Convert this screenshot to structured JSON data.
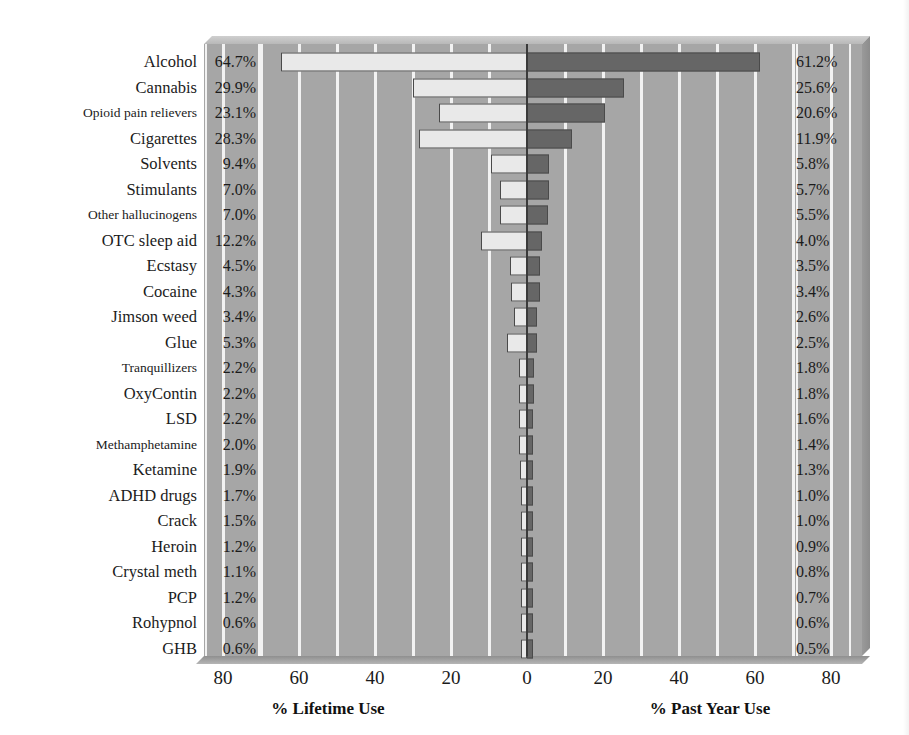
{
  "chart_data": {
    "type": "bar",
    "orientation": "horizontal",
    "layout": "diverging-bidirectional",
    "title": "",
    "subtitle": "",
    "xlabel_left": "% Lifetime Use",
    "xlabel_right": "% Past Year Use",
    "ylabel": "",
    "grid": true,
    "grid_orientation": "vertical",
    "legend": "none",
    "axis": {
      "left_max": 80,
      "right_max": 80,
      "tick_step": 20,
      "tick_labels": [
        "80",
        "60",
        "40",
        "20",
        "0",
        "20",
        "40",
        "60",
        "80"
      ],
      "tick_values": [
        -80,
        -60,
        -40,
        -20,
        0,
        20,
        40,
        60,
        80
      ],
      "gridline_step": 10
    },
    "categories": [
      "Alcohol",
      "Cannabis",
      "Opioid pain relievers",
      "Cigarettes",
      "Solvents",
      "Stimulants",
      "Other hallucinogens",
      "OTC sleep aid",
      "Ecstasy",
      "Cocaine",
      "Jimson weed",
      "Glue",
      "Tranquillizers",
      "OxyContin",
      "LSD",
      "Methamphetamine",
      "Ketamine",
      "ADHD drugs",
      "Crack",
      "Heroin",
      "Crystal meth",
      "PCP",
      "Rohypnol",
      "GHB"
    ],
    "series": [
      {
        "name": "% Lifetime Use",
        "side": "left",
        "color": "#e9e9e9",
        "values": [
          64.7,
          29.9,
          23.1,
          28.3,
          9.4,
          7.0,
          7.0,
          12.2,
          4.5,
          4.3,
          3.4,
          5.3,
          2.2,
          2.2,
          2.2,
          2.0,
          1.9,
          1.7,
          1.5,
          1.2,
          1.1,
          1.2,
          0.6,
          0.6
        ],
        "labels": [
          "64.7%",
          "29.9%",
          "23.1%",
          "28.3%",
          "9.4%",
          "7.0%",
          "7.0%",
          "12.2%",
          "4.5%",
          "4.3%",
          "3.4%",
          "5.3%",
          "2.2%",
          "2.2%",
          "2.2%",
          "2.0%",
          "1.9%",
          "1.7%",
          "1.5%",
          "1.2%",
          "1.1%",
          "1.2%",
          "0.6%",
          "0.6%"
        ]
      },
      {
        "name": "% Past Year Use",
        "side": "right",
        "color": "#666666",
        "values": [
          61.2,
          25.6,
          20.6,
          11.9,
          5.8,
          5.7,
          5.5,
          4.0,
          3.5,
          3.4,
          2.6,
          2.5,
          1.8,
          1.8,
          1.6,
          1.4,
          1.3,
          1.0,
          1.0,
          0.9,
          0.8,
          0.7,
          0.6,
          0.5
        ],
        "labels": [
          "61.2%",
          "25.6%",
          "20.6%",
          "11.9%",
          "5.8%",
          "5.7%",
          "5.5%",
          "4.0%",
          "3.5%",
          "3.4%",
          "2.6%",
          "2.5%",
          "1.8%",
          "1.8%",
          "1.6%",
          "1.4%",
          "1.3%",
          "1.0%",
          "1.0%",
          "0.9%",
          "0.8%",
          "0.7%",
          "0.6%",
          "0.5%"
        ]
      }
    ]
  },
  "style": {
    "plot_background": "#a6a6a6",
    "gridline_color": "#f2f2f2",
    "zero_line_color": "#3a3a3a",
    "bar_left_fill": "#e9e9e9",
    "bar_right_fill": "#666666",
    "bar_border": "#4a4a4a",
    "text_color": "#1b1b1b",
    "page_background": "#ffffff"
  }
}
